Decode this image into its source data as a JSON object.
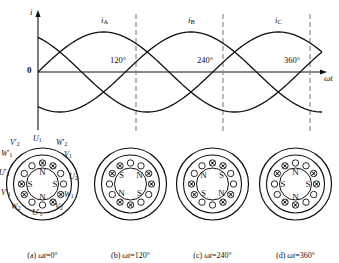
{
  "chart_data": {
    "type": "line",
    "title": "",
    "xlabel": "ωt",
    "ylabel": "i",
    "origin_label": "0",
    "xlim": [
      0,
      390
    ],
    "ylim": [
      -1.15,
      1.15
    ],
    "grid": false,
    "legend": "inline-curve-labels",
    "tick_labels": [
      "120°",
      "240°",
      "360°"
    ],
    "tick_values": [
      120,
      240,
      360
    ],
    "dashed_verticals": [
      120,
      240,
      360
    ],
    "series": [
      {
        "name": "iA",
        "label": "i",
        "subscript": "A",
        "phase_deg": 0,
        "amplitude": 1,
        "label_at_deg": 90
      },
      {
        "name": "iB",
        "label": "i",
        "subscript": "B",
        "phase_deg": -120,
        "amplitude": 1,
        "label_at_deg": 210
      },
      {
        "name": "iC",
        "label": "i",
        "subscript": "C",
        "phase_deg": -240,
        "amplitude": 1,
        "label_at_deg": 330
      }
    ]
  },
  "stators": [
    {
      "id": "a",
      "caption_index": "(a)",
      "caption_var": "ωt",
      "caption_value": "=0°",
      "poles": [
        {
          "letter": "N",
          "pos": "top"
        },
        {
          "letter": "S",
          "pos": "left"
        },
        {
          "letter": "S",
          "pos": "right"
        },
        {
          "letter": "N",
          "pos": "bottom"
        }
      ],
      "terminals": [
        {
          "base": "V",
          "sub": "2",
          "prime": true,
          "place": "top-left"
        },
        {
          "base": "U",
          "sub": "1",
          "prime": false,
          "place": "top"
        },
        {
          "base": "W",
          "sub": "2",
          "prime": true,
          "place": "top-right"
        },
        {
          "base": "W",
          "sub": "1",
          "prime": true,
          "place": "left-upper"
        },
        {
          "base": "V",
          "sub": "1",
          "prime": false,
          "place": "right-upper"
        },
        {
          "base": "U",
          "sub": "2",
          "prime": true,
          "place": "left"
        },
        {
          "base": "U",
          "sub": "2",
          "prime": false,
          "place": "right"
        },
        {
          "base": "V",
          "sub": "1",
          "prime": true,
          "place": "left-lower"
        },
        {
          "base": "W",
          "sub": "1",
          "prime": false,
          "place": "right-lower"
        },
        {
          "base": "W",
          "sub": "2",
          "prime": false,
          "place": "bottom-left"
        },
        {
          "base": "U",
          "sub": "1",
          "prime": true,
          "place": "bottom"
        },
        {
          "base": "V",
          "sub": "2",
          "prime": false,
          "place": "bottom-right"
        }
      ]
    },
    {
      "id": "b",
      "caption_index": "(b)",
      "caption_var": "ωt",
      "caption_value": "=120°",
      "poles": [
        {
          "letter": "S",
          "pos": "top-left"
        },
        {
          "letter": "N",
          "pos": "top-right"
        },
        {
          "letter": "N",
          "pos": "bottom-left"
        },
        {
          "letter": "S",
          "pos": "bottom-right"
        }
      ],
      "terminals": []
    },
    {
      "id": "c",
      "caption_index": "(c)",
      "caption_var": "ωt",
      "caption_value": "=240°",
      "poles": [
        {
          "letter": "N",
          "pos": "top-left"
        },
        {
          "letter": "S",
          "pos": "top-right"
        },
        {
          "letter": "S",
          "pos": "bottom-left"
        },
        {
          "letter": "N",
          "pos": "bottom-right"
        }
      ],
      "terminals": []
    },
    {
      "id": "d",
      "caption_index": "(d)",
      "caption_var": "ωt",
      "caption_value": "=360°",
      "poles": [
        {
          "letter": "N",
          "pos": "top"
        },
        {
          "letter": "S",
          "pos": "left"
        },
        {
          "letter": "S",
          "pos": "right"
        },
        {
          "letter": "N",
          "pos": "bottom"
        }
      ],
      "terminals": []
    }
  ],
  "colors": {
    "ink": "#111111",
    "dash": "#808080",
    "background": "#ffffff"
  }
}
